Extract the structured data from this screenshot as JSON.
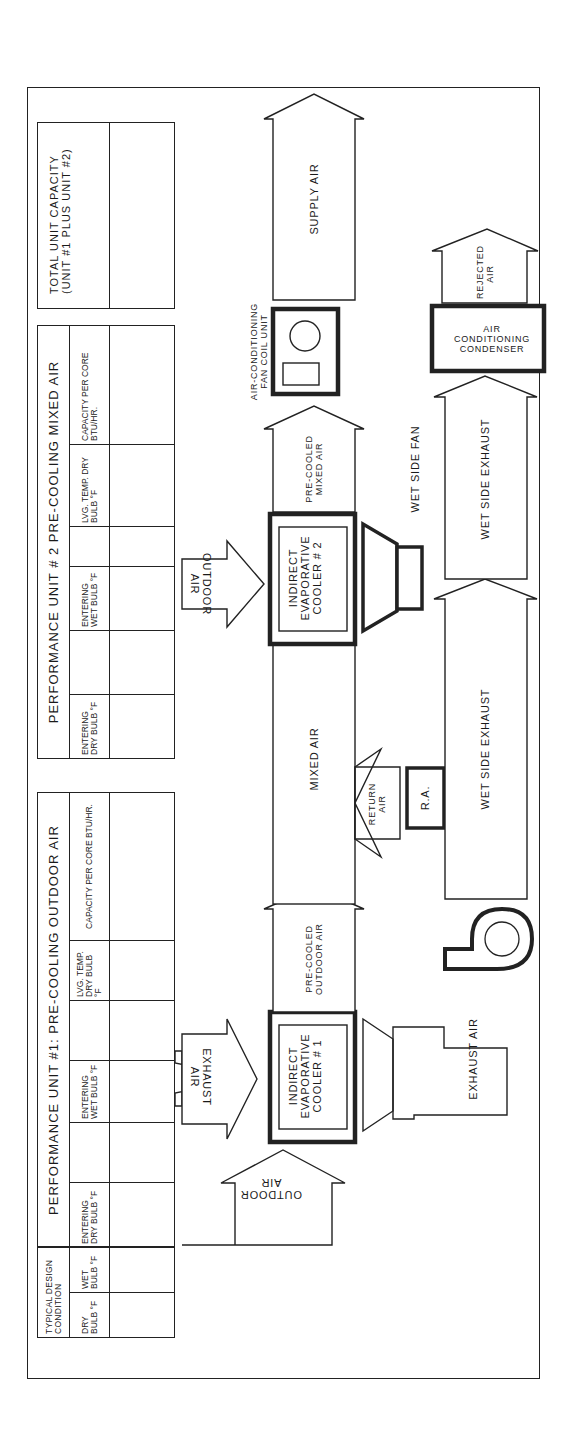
{
  "tables": {
    "typical": {
      "title": "Typical Design Condition",
      "columns": [
        "Dry Bulb °F",
        "Wet Bulb °F"
      ]
    },
    "unit1": {
      "title": "Performance Unit #1: Pre-Cooling Outdoor Air",
      "columns": [
        "Entering Dry Bulb °F",
        "",
        "Entering Wet Bulb °F",
        "",
        "Lvg. Temp. Dry Bulb °F",
        "Capacity Per Core BTU/HR."
      ]
    },
    "unit2": {
      "title": "Performance Unit # 2 Pre-Cooling Mixed Air",
      "columns": [
        "Entering Dry Bulb °F",
        "",
        "Entering Wet Bulb °F",
        "",
        "Lvg. Temp. Dry Bulb °F",
        "Capacity Per Core BTU/HR."
      ]
    },
    "total": {
      "title": "Total Unit Capacity (Unit #1 Plus Unit #2)"
    }
  },
  "flow": {
    "outdoor_air_1": "Outdoor\nAir",
    "exhaust_air_in": "Exhaust\nAir",
    "cooler_1": "Indirect\nEvaporative\nCooler # 1",
    "exhaust_air_out": "Exhaust Air",
    "precooled_outdoor_air": "Pre-Cooled\nOutdoor Air",
    "mixed_air": "Mixed Air",
    "return_air": "Return\nAir",
    "ra_box": "R.A.",
    "wet_side_exhaust_1": "Wet Side Exhaust",
    "outdoor_air_2": "Outdoor\nAir",
    "cooler_2": "Indirect\nEvaporative\nCooler # 2",
    "wet_side_fan": "Wet Side Fan",
    "wet_side_exhaust_2": "Wet Side Exhaust",
    "precooled_mixed_air": "Pre-Cooled\nMixed Air",
    "fan_coil_unit": "Air-Conditioning\nFan Coil Unit",
    "condenser": "Air Conditioning\nCondenser",
    "rejected_air": "Rejected\nAir",
    "supply_air": "Supply Air"
  }
}
